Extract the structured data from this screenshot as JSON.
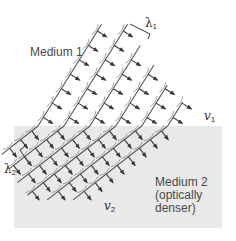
{
  "diagram": {
    "medium1": {
      "label": "Medium 1",
      "background": "#ffffff"
    },
    "medium2": {
      "label_line1": "Medium 2",
      "label_line2": "(optically",
      "label_line3": "denser)",
      "background": "#e9e9e9"
    },
    "symbols": {
      "lambda1": {
        "letter": "λ",
        "sub": "1"
      },
      "lambda2": {
        "letter": "λ",
        "sub": "2"
      },
      "v1": {
        "letter": "v",
        "sub": "1"
      },
      "v2": {
        "letter": "v",
        "sub": "2"
      }
    },
    "colors": {
      "wavefront": "#555555",
      "arrow": "#3a3a3a",
      "wavelet": "#777777",
      "text": "#4a4a4a"
    }
  }
}
